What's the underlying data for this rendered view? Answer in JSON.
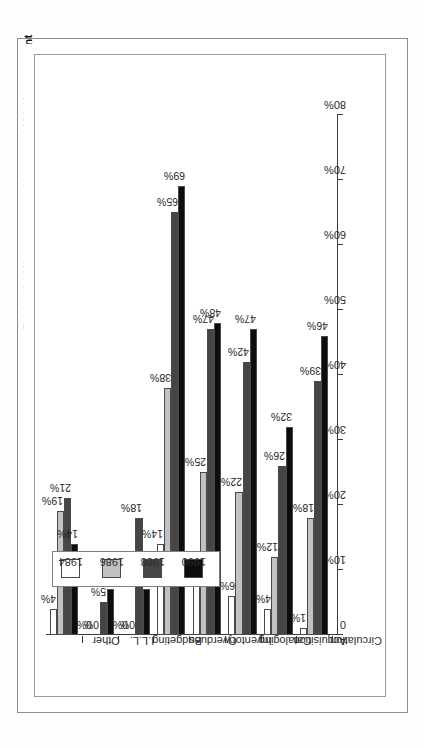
{
  "figure": {
    "title": "Table 18  /  Microcomputer Usage in LMC Management"
  },
  "legend": {
    "items": [
      {
        "label": "1984",
        "color": "#ffffff"
      },
      {
        "label": "1986",
        "color": "#c2c2c2"
      },
      {
        "label": "1988",
        "color": "#454545"
      },
      {
        "label": "1990",
        "color": "#0d0d0d"
      }
    ]
  },
  "axis": {
    "tick_labels": [
      "0",
      "10%",
      "20%",
      "30%",
      "40%",
      "50%",
      "60%",
      "70%",
      "80%"
    ]
  },
  "chart_data": {
    "type": "bar",
    "orientation": "horizontal",
    "title": "Table 18  /  Microcomputer Usage in LMC Management",
    "xlabel": "",
    "ylabel": "",
    "xlim": [
      0,
      80
    ],
    "grid": false,
    "legend_position": "upper-left",
    "categories": [
      "Circulation",
      "Acquisition",
      "Cataloging",
      "Inventory",
      "Overdues",
      "Budgeting",
      "I.L.L.",
      "Other"
    ],
    "series": [
      {
        "name": "1984",
        "color": "#ffffff",
        "values": [
          1,
          4,
          6,
          9,
          14,
          0,
          0,
          4
        ],
        "labels": [
          "1%",
          "4%",
          "6%",
          "9%",
          "14%",
          "0%",
          "0%",
          "4%"
        ]
      },
      {
        "name": "1986",
        "color": "#c2c2c2",
        "values": [
          18,
          12,
          22,
          25,
          38,
          0,
          0,
          19
        ],
        "labels": [
          "18%",
          "12%",
          "22%",
          "25%",
          "38%",
          "0%",
          "0%",
          "19%"
        ]
      },
      {
        "name": "1988",
        "color": "#454545",
        "values": [
          39,
          26,
          42,
          47,
          65,
          18,
          5,
          21
        ],
        "labels": [
          "39%",
          "26%",
          "42%",
          "47%",
          "65%",
          "18%",
          "5%",
          "21%"
        ]
      },
      {
        "name": "1990",
        "color": "#0d0d0d",
        "values": [
          46,
          32,
          47,
          48,
          69,
          7,
          7,
          14
        ],
        "labels": [
          "46%",
          "32%",
          "47%",
          "48%",
          "69%",
          "7%",
          "7%",
          "14%"
        ]
      }
    ]
  }
}
